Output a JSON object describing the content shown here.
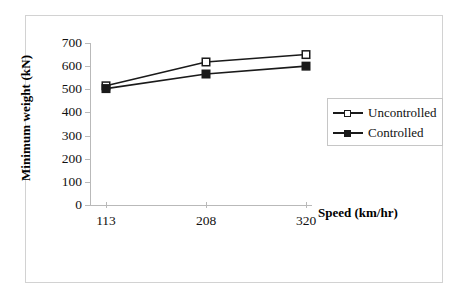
{
  "chart_data": {
    "type": "line",
    "title": "",
    "xlabel": "Speed (km/hr)",
    "ylabel": "Minimum weight (kN)",
    "categories": [
      "113",
      "208",
      "320"
    ],
    "series": [
      {
        "name": "Uncontrolled",
        "marker": "open-square",
        "values": [
          515,
          618,
          650
        ]
      },
      {
        "name": "Controlled",
        "marker": "filled-square",
        "values": [
          503,
          566,
          600
        ]
      }
    ],
    "ylim": [
      0,
      700
    ],
    "yticks": [
      "0",
      "100",
      "200",
      "300",
      "400",
      "500",
      "600",
      "700"
    ],
    "grid": false,
    "legend_position": "right-middle"
  },
  "legend": {
    "items": [
      {
        "label": "Uncontrolled"
      },
      {
        "label": "Controlled"
      }
    ]
  },
  "colors": {
    "series_line": "#1a1a1a",
    "axis": "#b9b9b9",
    "frame": "#d2d2d2",
    "text": "#111111"
  }
}
